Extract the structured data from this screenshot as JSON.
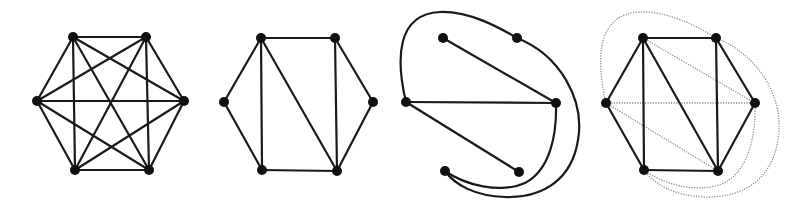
{
  "figure": {
    "width": 810,
    "height": 212,
    "colors": {
      "edge": "#1a1a1a",
      "vertex": "#111111",
      "dotted_edge": "#8a8a8a",
      "background": "#ffffff"
    },
    "vertex_radius": 5,
    "panels": [
      {
        "id": "K6",
        "description": "Complete graph on 6 vertices",
        "vertices": [
          [
            73,
            37
          ],
          [
            146,
            37
          ],
          [
            37,
            101
          ],
          [
            184,
            101
          ],
          [
            75,
            170
          ],
          [
            149,
            170
          ]
        ],
        "edges": [
          [
            0,
            1
          ],
          [
            0,
            2
          ],
          [
            0,
            3
          ],
          [
            0,
            4
          ],
          [
            0,
            5
          ],
          [
            1,
            2
          ],
          [
            1,
            3
          ],
          [
            1,
            4
          ],
          [
            1,
            5
          ],
          [
            2,
            3
          ],
          [
            2,
            4
          ],
          [
            2,
            5
          ],
          [
            3,
            4
          ],
          [
            3,
            5
          ],
          [
            4,
            5
          ]
        ],
        "curves": [],
        "dotted_edges": [],
        "dotted_curves": []
      },
      {
        "id": "G",
        "description": "Planar subgraph: hexagon with three chords",
        "vertices": [
          [
            261,
            38
          ],
          [
            335,
            38
          ],
          [
            224,
            102
          ],
          [
            373,
            102
          ],
          [
            262,
            170
          ],
          [
            337,
            171
          ]
        ],
        "edges": [
          [
            0,
            1
          ],
          [
            0,
            2
          ],
          [
            1,
            3
          ],
          [
            2,
            4
          ],
          [
            3,
            5
          ],
          [
            4,
            5
          ],
          [
            0,
            4
          ],
          [
            0,
            5
          ],
          [
            1,
            5
          ]
        ],
        "curves": [],
        "dotted_edges": [],
        "dotted_curves": []
      },
      {
        "id": "G-complement",
        "description": "Complement graph drawn planar with curved edges",
        "vertices": [
          [
            443,
            38
          ],
          [
            517,
            38
          ],
          [
            406,
            102
          ],
          [
            556,
            103
          ],
          [
            445,
            171
          ],
          [
            519,
            172
          ]
        ],
        "edges": [
          [
            0,
            3
          ],
          [
            2,
            3
          ],
          [
            2,
            5
          ]
        ],
        "curves": [
          "M406,102 C396,60 396,14 440,12 C470,11 500,28 517,38",
          "M517,38 C560,55 585,100 578,140 C572,178 545,198 505,197 C475,196 455,185 445,171",
          "M556,103 C557,135 550,170 525,183 C500,194 465,185 445,171"
        ],
        "dotted_edges": [],
        "dotted_curves": []
      },
      {
        "id": "G-plus-complement",
        "description": "Overlay of G (solid) and its complement (dotted)",
        "vertices": [
          [
            643,
            38
          ],
          [
            716,
            38
          ],
          [
            606,
            103
          ],
          [
            755,
            103
          ],
          [
            644,
            170
          ],
          [
            718,
            171
          ]
        ],
        "edges": [
          [
            0,
            1
          ],
          [
            0,
            2
          ],
          [
            1,
            3
          ],
          [
            2,
            4
          ],
          [
            3,
            5
          ],
          [
            4,
            5
          ],
          [
            0,
            4
          ],
          [
            0,
            5
          ],
          [
            1,
            5
          ]
        ],
        "curves": [],
        "dotted_edges": [
          [
            0,
            3
          ],
          [
            2,
            3
          ],
          [
            2,
            5
          ]
        ],
        "dotted_curves": [
          "M606,103 C596,60 596,14 640,12 C670,11 700,28 716,38",
          "M716,38 C760,55 785,100 778,140 C772,178 745,198 705,197 C675,196 655,185 644,170",
          "M755,103 C756,135 749,170 724,183 C699,194 664,185 644,170"
        ]
      }
    ]
  }
}
